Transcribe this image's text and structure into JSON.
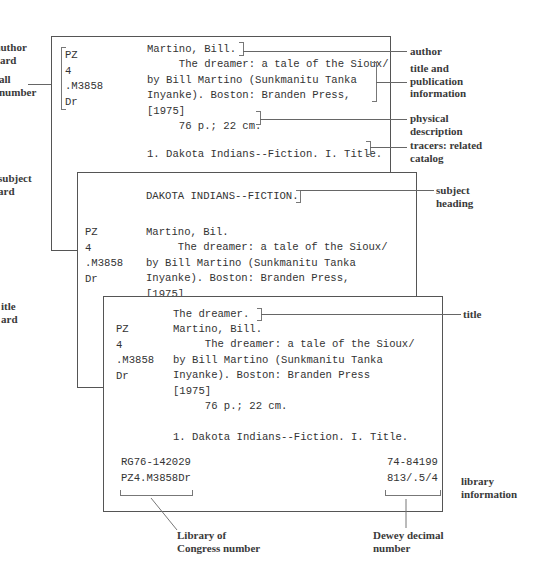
{
  "left_labels": {
    "author_card": "author\ncard",
    "call_number": "all\nnumber",
    "subject_card": "subject\nard",
    "title_card": "itle\nard"
  },
  "right_labels": {
    "author": "author",
    "title_pub": "title and\npublication\ninformation",
    "physical": "physical\ndescription",
    "tracers": "tracers: related\ncatalog",
    "subject_heading": "subject\nheading",
    "title": "title",
    "library_info": "library\ninformation"
  },
  "bottom_labels": {
    "loc": "Library of\nCongress number",
    "dewey": "Dewey decimal\nnumber"
  },
  "author_card": {
    "call": "PZ\n4\n.M3858\nDr",
    "author": "Martino, Bill.",
    "body": "     The dreamer: a tale of the Sioux/\nby Bill Martino (Sunkmanitu Tanka\nInyanke). Boston: Branden Press,\n[1975]",
    "physical": "     76 p.; 22 cm.",
    "tracers": "1. Dakota Indians--Fiction. I. Title."
  },
  "subject_card": {
    "heading": "DAKOTA INDIANS--FICTION.",
    "call": "PZ\n4\n.M3858\nDr",
    "author": "Martino, Bil.",
    "body": "     The dreamer: a tale of the Sioux/\nby Bill Martino (Sunkmanitu Tanka\nInyanke). Boston: Branden Press,\n[1975]\n     76 p.; 22 cm."
  },
  "title_card": {
    "title": "The dreamer.",
    "call": "PZ\n4\n.M3858\nDr",
    "author": "Martino, Bill.",
    "body": "     The dreamer: a tale of the Sioux/\nby Bill Martino (Sunkmanitu Tanka\nInyanke). Boston: Branden Press\n[1975]\n     76 p.; 22 cm.\n\n1. Dakota Indians--Fiction. I. Title.",
    "loc_numbers": "RG76-142029\nPZ4.M3858Dr",
    "dewey_numbers": "74-84199\n813/.5/4"
  }
}
